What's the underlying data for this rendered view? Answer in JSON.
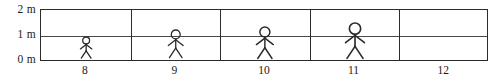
{
  "chart_data": {
    "type": "bar",
    "title": "",
    "xlabel": "",
    "ylabel": "",
    "categories": [
      "8",
      "9",
      "10",
      "11",
      "12"
    ],
    "values": [
      0.85,
      1.1,
      1.25,
      1.4,
      0
    ],
    "ylim": [
      0,
      2
    ],
    "yticks": [
      0,
      1,
      2
    ],
    "ytick_labels": [
      "0 m",
      "1 m",
      "2 m"
    ],
    "grid": true,
    "legend": "none",
    "series": [
      {
        "name": "height",
        "values": [
          0.85,
          1.1,
          1.25,
          1.4,
          0
        ]
      }
    ]
  },
  "axes": {
    "y_labels": [
      {
        "id": "y2",
        "text": "2 m"
      },
      {
        "id": "y1",
        "text": "1 m"
      },
      {
        "id": "y0",
        "text": "0 m"
      }
    ],
    "x_labels": [
      {
        "id": "x8",
        "text": "8"
      },
      {
        "id": "x9",
        "text": "9"
      },
      {
        "id": "x10",
        "text": "10"
      },
      {
        "id": "x11",
        "text": "11"
      },
      {
        "id": "x12",
        "text": "12"
      }
    ]
  },
  "figures": [
    {
      "category": "8",
      "height_m": 0.85,
      "present": true
    },
    {
      "category": "9",
      "height_m": 1.1,
      "present": true
    },
    {
      "category": "10",
      "height_m": 1.25,
      "present": true
    },
    {
      "category": "11",
      "height_m": 1.4,
      "present": true
    },
    {
      "category": "12",
      "height_m": 0,
      "present": false
    }
  ],
  "colors": {
    "ink": "#2b2b2b",
    "gridline": "#4a4a4a",
    "background": "#ffffff"
  }
}
